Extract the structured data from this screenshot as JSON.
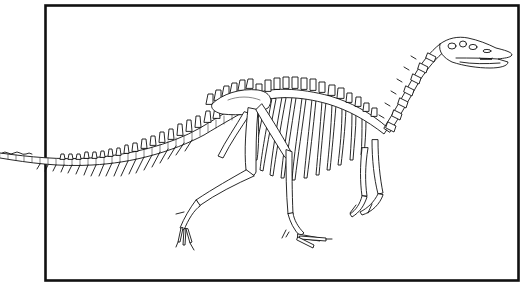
{
  "figure": {
    "colors": {
      "background": "#ffffff",
      "ink": "#111111",
      "frame": "#111111"
    },
    "frame": {
      "x": 45,
      "y": 5,
      "width": 474,
      "height": 276,
      "stroke_width": 2.5
    },
    "parts": [
      "frame",
      "tail",
      "dorsal-vertebrae",
      "ribs",
      "pelvis",
      "hind-leg-left",
      "hind-leg-right",
      "forelimbs",
      "neck",
      "skull"
    ]
  }
}
